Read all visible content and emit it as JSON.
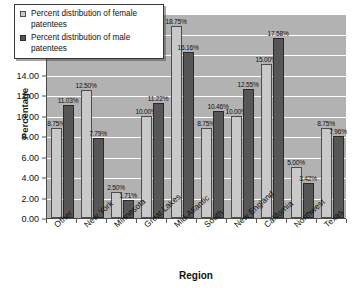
{
  "chart_data": {
    "type": "bar",
    "title": "",
    "xlabel": "Region",
    "ylabel": "Percentage",
    "ylim": [
      0,
      20
    ],
    "ytick_step": 2,
    "ytick_labels": [
      "0.00",
      "2.00",
      "4.00",
      "6.00",
      "8.00",
      "10.00",
      "12.00",
      "14.00",
      "16.00",
      "18.00",
      "20.00"
    ],
    "grid": true,
    "legend_position": "top-left",
    "categories": [
      "Other",
      "New York",
      "Minnesota",
      "Great Lakes",
      "Mid-Atlantic",
      "South",
      "New England",
      "California",
      "Northwest",
      "Texas"
    ],
    "series": [
      {
        "name": "Percent distribution of female patentees",
        "color": "#c9c9c9",
        "values": [
          8.75,
          12.5,
          2.5,
          10.0,
          18.75,
          8.75,
          10.0,
          15.0,
          5.0,
          8.75
        ],
        "labels": [
          "8.75%",
          "12.50%",
          "2.50%",
          "10.00%",
          "18.75%",
          "8.75%",
          "10.00%",
          "15.00%",
          "5.00%",
          "8.75%"
        ]
      },
      {
        "name": "Percent distribution of male patentees",
        "color": "#565656",
        "values": [
          11.03,
          7.79,
          1.71,
          11.22,
          16.16,
          10.46,
          12.55,
          17.58,
          3.42,
          7.96
        ],
        "labels": [
          "11.03%",
          "7.79%",
          "1.71%",
          "11.22%",
          "16.16%",
          "10.46%",
          "12.55%",
          "17.58%",
          "3.42%",
          "7.96%"
        ]
      }
    ]
  },
  "axes": {
    "y_title": "Percentage",
    "x_title": "Region"
  },
  "legend": {
    "items": [
      {
        "label": "Percent distribution of female patentees",
        "swatch": "female"
      },
      {
        "label": "Percent distribution of male patentees",
        "swatch": "male"
      }
    ]
  }
}
